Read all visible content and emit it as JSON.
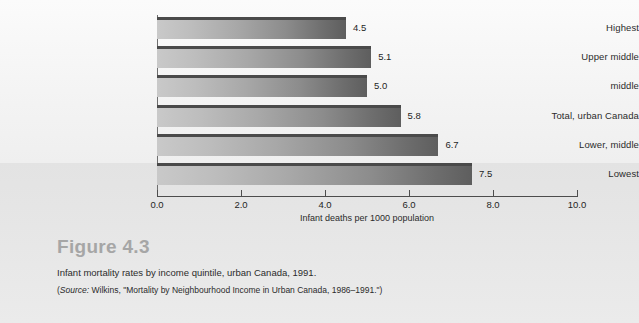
{
  "figure": {
    "number_label": "Figure 4.3",
    "caption": "Infant mortality rates by income quintile, urban Canada, 1991.",
    "source_prefix": "(",
    "source_word": "Source:",
    "source_text": " Wilkins, \"Mortality by Neighbourhood Income in Urban Canada, 1986–1991.\")"
  },
  "chart_data": {
    "type": "bar",
    "orientation": "horizontal",
    "title": "",
    "categories": [
      "Highest",
      "Upper middle",
      "middle",
      "Total, urban Canada",
      "Lower, middle",
      "Lowest"
    ],
    "values": [
      4.5,
      5.1,
      5.0,
      5.8,
      6.7,
      7.5
    ],
    "value_labels": [
      "4.5",
      "5.1",
      "5.0",
      "5.8",
      "6.7",
      "7.5"
    ],
    "xlabel": "Infant deaths per 1000 population",
    "ylabel": "",
    "xlim": [
      0.0,
      10.0
    ],
    "xticks": [
      0.0,
      2.0,
      4.0,
      6.0,
      8.0,
      10.0
    ],
    "xtick_labels": [
      "0.0",
      "2.0",
      "4.0",
      "6.0",
      "8.0",
      "10.0"
    ],
    "grid": false,
    "legend": "none",
    "bar_color_start": "#c9c9c9",
    "bar_color_end": "#5e5e5e",
    "bar_top_edge_color": "#4a4a4a"
  }
}
